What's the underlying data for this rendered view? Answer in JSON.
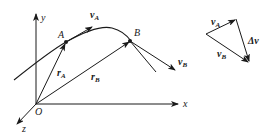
{
  "diagram": {
    "title": "",
    "colors": {
      "ink": "#1a1a1a",
      "background": "#ffffff"
    },
    "axes": {
      "origin_label": "O",
      "x_label": "x",
      "y_label": "y",
      "z_label": "z"
    },
    "points": [
      {
        "id": "A",
        "label": "A"
      },
      {
        "id": "B",
        "label": "B"
      }
    ],
    "vectors": {
      "vA": {
        "base": "v",
        "sub": "A"
      },
      "vB": {
        "base": "v",
        "sub": "B"
      },
      "rA": {
        "base": "r",
        "sub": "A"
      },
      "rB": {
        "base": "r",
        "sub": "B"
      }
    },
    "velocity_triangle": {
      "vA": {
        "base": "v",
        "sub": "A"
      },
      "vB": {
        "base": "v",
        "sub": "B"
      },
      "dv": "Δv"
    }
  }
}
